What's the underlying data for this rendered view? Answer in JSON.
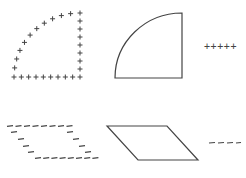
{
  "diagram": {
    "stroke_color": "#444444",
    "background": "#ffffff",
    "shapes": [
      {
        "id": "quarter-circle-plus",
        "type": "quarter-circle",
        "style": "plus-markers",
        "marker": "+",
        "corner": [
          80,
          77
        ],
        "radius": 66
      },
      {
        "id": "quarter-circle-solid",
        "type": "quarter-circle",
        "style": "solid",
        "corner": [
          182,
          78
        ],
        "radius": 67
      },
      {
        "id": "plus-legend",
        "type": "marker-row",
        "text": "+++++",
        "x": 205,
        "y": 46
      },
      {
        "id": "parallelogram-dash",
        "type": "parallelogram",
        "style": "dash-markers",
        "marker": "-",
        "points": [
          [
            7,
            126
          ],
          [
            68,
            126
          ],
          [
            95,
            158
          ],
          [
            34,
            158
          ]
        ]
      },
      {
        "id": "parallelogram-solid",
        "type": "parallelogram",
        "style": "solid",
        "points": [
          [
            107,
            126
          ],
          [
            167,
            126
          ],
          [
            198,
            160
          ],
          [
            138,
            160
          ]
        ]
      },
      {
        "id": "dash-legend",
        "type": "marker-row",
        "text": "----",
        "x": 209,
        "y": 143
      }
    ]
  },
  "labels": {
    "plus_row": "+++++",
    "dash_row": "----"
  }
}
